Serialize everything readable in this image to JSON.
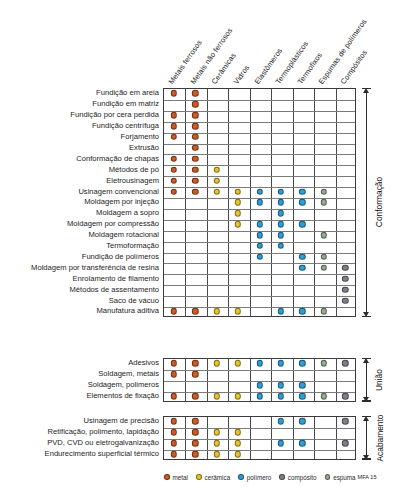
{
  "figure": {
    "columns": [
      "Metais ferrosos",
      "Metais não ferrosos",
      "Cerâmicas",
      "Vidros",
      "Elastômeros",
      "Termoplásticos",
      "Termofixos",
      "Espumas de polímeros",
      "Compósitos"
    ],
    "sections": [
      {
        "name": "Conformação",
        "rows": [
          {
            "label": "Fundição em areia",
            "dots": {
              "1": "metal",
              "2": "metal"
            }
          },
          {
            "label": "Fundição em matriz",
            "dots": {
              "2": "metal"
            }
          },
          {
            "label": "Fundição por cera perdida",
            "dots": {
              "1": "metal",
              "2": "metal"
            }
          },
          {
            "label": "Fundição centrífuga",
            "dots": {
              "1": "metal",
              "2": "metal"
            }
          },
          {
            "label": "Forjamento",
            "dots": {
              "1": "metal",
              "2": "metal"
            }
          },
          {
            "label": "Extrusão",
            "dots": {
              "2": "metal"
            }
          },
          {
            "label": "Conformação de chapas",
            "dots": {
              "1": "metal",
              "2": "metal"
            }
          },
          {
            "label": "Métodos de pó",
            "dots": {
              "1": "metal",
              "2": "metal",
              "3": "ceramica"
            }
          },
          {
            "label": "Eletrousinagem",
            "dots": {
              "1": "metal",
              "2": "metal",
              "3": "ceramica"
            }
          },
          {
            "label": "Usinagem convencional",
            "dots": {
              "1": "metal",
              "2": "metal",
              "3": "ceramica",
              "4": "ceramica",
              "5": "polimero",
              "6": "polimero",
              "7": "polimero",
              "8": "espuma"
            }
          },
          {
            "label": "Moldagem por injeção",
            "dots": {
              "4": "ceramica",
              "5": "polimero",
              "6": "polimero",
              "7": "polimero",
              "8": "espuma"
            }
          },
          {
            "label": "Moldagem a sopro",
            "dots": {
              "4": "ceramica",
              "6": "polimero"
            }
          },
          {
            "label": "Moldagem por compressão",
            "dots": {
              "4": "ceramica",
              "5": "polimero",
              "6": "polimero",
              "7": "polimero"
            }
          },
          {
            "label": "Moldagem rotacional",
            "dots": {
              "5": "polimero",
              "6": "polimero",
              "8": "espuma"
            }
          },
          {
            "label": "Termoformação",
            "dots": {
              "5": "polimero",
              "6": "polimero"
            }
          },
          {
            "label": "Fundição de polímeros",
            "dots": {
              "5": "polimero",
              "7": "polimero",
              "8": "espuma"
            }
          },
          {
            "label": "Moldagem por transferência de resina",
            "dots": {
              "7": "polimero",
              "8": "espuma",
              "9": "composito"
            }
          },
          {
            "label": "Enrolamento de filamento",
            "dots": {
              "9": "composito"
            }
          },
          {
            "label": "Métodos de assentamento",
            "dots": {
              "9": "composito"
            }
          },
          {
            "label": "Saco de vácuo",
            "dots": {
              "9": "composito"
            }
          },
          {
            "label": "Manufatura aditiva",
            "dots": {
              "1": "metal",
              "2": "metal",
              "3": "ceramica",
              "4": "ceramica",
              "6": "polimero",
              "7": "polimero",
              "8": "espuma"
            }
          }
        ]
      },
      {
        "name": "União",
        "rows": [
          {
            "label": "Adesivos",
            "dots": {
              "1": "metal",
              "2": "metal",
              "3": "ceramica",
              "4": "ceramica",
              "5": "polimero",
              "6": "polimero",
              "7": "polimero",
              "8": "espuma",
              "9": "composito"
            }
          },
          {
            "label": "Soldagem, metais",
            "dots": {
              "1": "metal",
              "2": "metal"
            }
          },
          {
            "label": "Soldagem, polimeros",
            "dots": {
              "5": "polimero",
              "6": "polimero",
              "7": "polimero"
            }
          },
          {
            "label": "Elementos de fixação",
            "dots": {
              "1": "metal",
              "2": "metal",
              "3": "ceramica",
              "4": "ceramica",
              "5": "polimero",
              "6": "polimero",
              "7": "polimero",
              "8": "espuma",
              "9": "composito"
            }
          }
        ]
      },
      {
        "name": "Acabamento",
        "rows": [
          {
            "label": "Usinagem de precisão",
            "dots": {
              "1": "metal",
              "2": "metal",
              "6": "polimero",
              "7": "polimero",
              "9": "composito"
            }
          },
          {
            "label": "Retificação, polimento, lapidação",
            "dots": {
              "1": "metal",
              "2": "metal",
              "3": "ceramica",
              "4": "ceramica"
            }
          },
          {
            "label": "PVD, CVD ou eletrogalvanização",
            "dots": {
              "1": "metal",
              "2": "metal",
              "3": "ceramica",
              "4": "ceramica",
              "6": "polimero",
              "7": "polimero",
              "9": "composito"
            }
          },
          {
            "label": "Endurecimento superficial térmico",
            "dots": {
              "1": "metal",
              "2": "metal",
              "3": "ceramica",
              "4": "ceramica"
            }
          }
        ]
      }
    ],
    "legend": {
      "items": [
        {
          "key": "metal",
          "label": "metal"
        },
        {
          "key": "ceramica",
          "label": "cerâmica"
        },
        {
          "key": "polimero",
          "label": "polímero"
        },
        {
          "key": "composito",
          "label": "compósito"
        },
        {
          "key": "espuma",
          "label": "espuma"
        }
      ],
      "source": "MFA 15"
    },
    "colors": {
      "metal": "#cc5a22",
      "ceramica": "#e8c429",
      "polimero": "#2b9fd6",
      "composito": "#7f7f8c",
      "espuma": "#94a894",
      "grid": "#4a4a4a",
      "border": "#3b3b3b",
      "text": "#1d1d1d"
    }
  }
}
